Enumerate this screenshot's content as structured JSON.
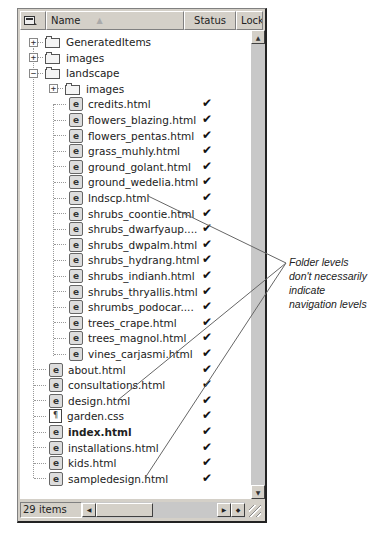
{
  "header": {
    "icon_column": "site-view-icon",
    "name_label": "Name",
    "status_label": "Status",
    "locked_label": "Locke"
  },
  "tree": [
    {
      "label": "GeneratedItems",
      "type": "folder",
      "level": 0,
      "expander": "+",
      "checked": false
    },
    {
      "label": "images",
      "type": "folder",
      "level": 0,
      "expander": "+",
      "checked": false
    },
    {
      "label": "landscape",
      "type": "folder",
      "level": 0,
      "expander": "−",
      "checked": false
    },
    {
      "label": "images",
      "type": "folder",
      "level": 1,
      "expander": "+",
      "checked": false
    },
    {
      "label": "credits.html",
      "type": "html",
      "level": 1,
      "checked": true
    },
    {
      "label": "flowers_blazing.html",
      "type": "html",
      "level": 1,
      "checked": true
    },
    {
      "label": "flowers_pentas.html",
      "type": "html",
      "level": 1,
      "checked": true
    },
    {
      "label": "grass_muhly.html",
      "type": "html",
      "level": 1,
      "checked": true
    },
    {
      "label": "ground_golant.html",
      "type": "html",
      "level": 1,
      "checked": true
    },
    {
      "label": "ground_wedelia.html",
      "type": "html",
      "level": 1,
      "checked": true
    },
    {
      "label": "lndscp.html",
      "type": "html",
      "level": 1,
      "checked": true
    },
    {
      "label": "shrubs_coontie.html",
      "type": "html",
      "level": 1,
      "checked": true
    },
    {
      "label": "shrubs_dwarfyaup....",
      "type": "html",
      "level": 1,
      "checked": true
    },
    {
      "label": "shrubs_dwpalm.html",
      "type": "html",
      "level": 1,
      "checked": true
    },
    {
      "label": "shrubs_hydrang.html",
      "type": "html",
      "level": 1,
      "checked": true
    },
    {
      "label": "shrubs_indianh.html",
      "type": "html",
      "level": 1,
      "checked": true
    },
    {
      "label": "shrubs_thryallis.html",
      "type": "html",
      "level": 1,
      "checked": true
    },
    {
      "label": "shrumbs_podocar....",
      "type": "html",
      "level": 1,
      "checked": true
    },
    {
      "label": "trees_crape.html",
      "type": "html",
      "level": 1,
      "checked": true
    },
    {
      "label": "trees_magnol.html",
      "type": "html",
      "level": 1,
      "checked": true
    },
    {
      "label": "vines_carjasmi.html",
      "type": "html",
      "level": 1,
      "checked": true
    },
    {
      "label": "about.html",
      "type": "html",
      "level": 0,
      "checked": true
    },
    {
      "label": "consultations.html",
      "type": "html",
      "level": 0,
      "checked": true
    },
    {
      "label": "design.html",
      "type": "html",
      "level": 0,
      "checked": true
    },
    {
      "label": "garden.css",
      "type": "css",
      "level": 0,
      "checked": true
    },
    {
      "label": "index.html",
      "type": "html",
      "level": 0,
      "checked": true,
      "bold": true
    },
    {
      "label": "installations.html",
      "type": "html",
      "level": 0,
      "checked": true
    },
    {
      "label": "kids.html",
      "type": "html",
      "level": 0,
      "checked": true
    },
    {
      "label": "sampledesign.html",
      "type": "html",
      "level": 0,
      "checked": true
    }
  ],
  "check_glyph": "✔",
  "statusbar": {
    "item_count": "29 items"
  },
  "scroll": {
    "up": "▲",
    "down": "▼",
    "left": "◀",
    "right": "▶",
    "toggle": "◆"
  },
  "annotation": {
    "text": "Folder levels don't necessarily indicate navigation levels"
  }
}
